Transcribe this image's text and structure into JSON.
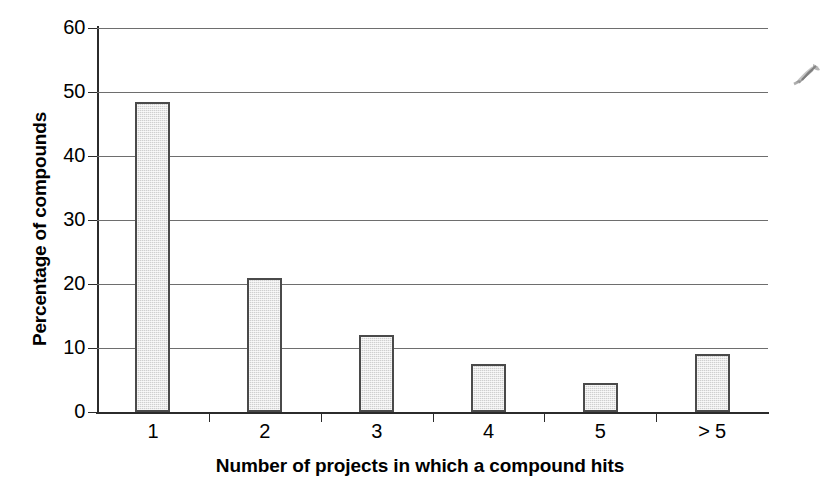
{
  "chart_data": {
    "type": "bar",
    "title": "",
    "xlabel": "Number of projects in which a compound hits",
    "ylabel": "Percentage of compounds",
    "categories": [
      "1",
      "2",
      "3",
      "4",
      "5",
      "> 5"
    ],
    "values": [
      48.5,
      21.0,
      12.0,
      7.5,
      4.5,
      9.0
    ],
    "ylim": [
      0,
      60
    ],
    "yticks": [
      0,
      10,
      20,
      30,
      40,
      50,
      60
    ],
    "ytick_labels": [
      "0",
      "10",
      "20",
      "30",
      "40",
      "50",
      "60"
    ],
    "grid": "horizontal",
    "legend": "none",
    "bar_fill_color": "#cfcfcf",
    "bar_border_color": "#4a4a4a",
    "axis_color": "#2b2b2b",
    "gridline_color": "#6e6e6e",
    "background_color": "#ffffff"
  },
  "annotations": {
    "scan_artifact": "handwritten-ink-mark"
  }
}
